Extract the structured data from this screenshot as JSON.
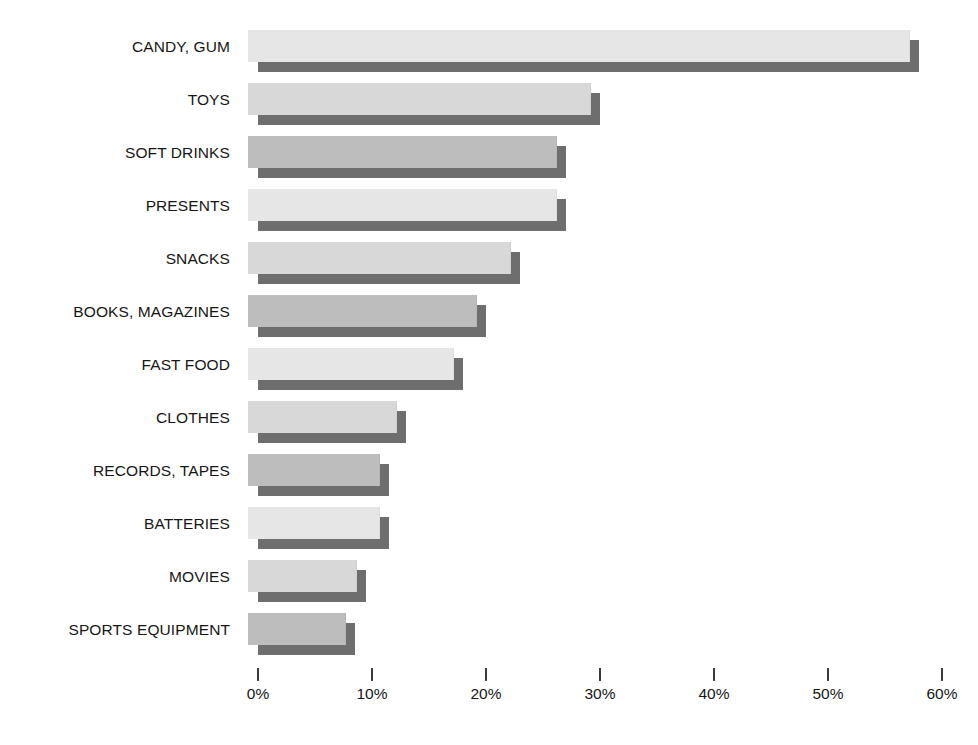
{
  "chart_data": {
    "type": "bar",
    "orientation": "horizontal",
    "title": "",
    "subtitle": "",
    "xlabel": "",
    "ylabel": "",
    "xlim": [
      0,
      60
    ],
    "grid": false,
    "legend": null,
    "value_suffix": "%",
    "categories": [
      "CANDY, GUM",
      "TOYS",
      "SOFT DRINKS",
      "PRESENTS",
      "SNACKS",
      "BOOKS, MAGAZINES",
      "FAST FOOD",
      "CLOTHES",
      "RECORDS, TAPES",
      "BATTERIES",
      "MOVIES",
      "SPORTS EQUIPMENT"
    ],
    "values": [
      58,
      30,
      27,
      27,
      23,
      20,
      18,
      13,
      11.5,
      11.5,
      9.5,
      8.5
    ],
    "bar_colors": [
      "#e6e6e6",
      "#d8d8d8",
      "#bdbdbd",
      "#e6e6e6",
      "#d8d8d8",
      "#bdbdbd",
      "#e6e6e6",
      "#d8d8d8",
      "#bdbdbd",
      "#e6e6e6",
      "#d8d8d8",
      "#bdbdbd"
    ],
    "shadow_color": "#6e6e6e",
    "xticks": [
      0,
      10,
      20,
      30,
      40,
      50,
      60
    ],
    "xtick_labels": [
      "0%",
      "10%",
      "20%",
      "30%",
      "40%",
      "50%",
      "60%"
    ]
  },
  "axis": {
    "tick_color": "#3a3a3a",
    "label_color": "#161616"
  },
  "canvas": {
    "background": "#ffffff"
  }
}
